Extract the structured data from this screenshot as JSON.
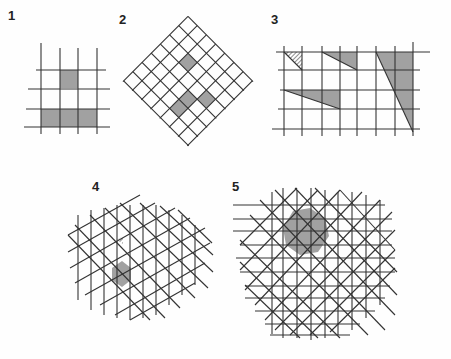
{
  "figure": {
    "panels": [
      {
        "id": "1",
        "label": "1",
        "description": "Square grid with hatched single cell and hatched bottom row"
      },
      {
        "id": "2",
        "label": "2",
        "description": "Diagonal (45°) square grid with hatched V-shaped cells"
      },
      {
        "id": "3",
        "label": "3",
        "description": "Square grid with hatched triangles of varying slopes"
      },
      {
        "id": "4",
        "label": "4",
        "description": "Triangular/isometric grid with hatched hexagon and outlined parallelogram"
      },
      {
        "id": "5",
        "label": "5",
        "description": "Overlaid square and diagonal grids with hatched octagon"
      }
    ],
    "colors": {
      "line": "#333333",
      "hatch": "#444444",
      "background": "#fefefe"
    }
  }
}
